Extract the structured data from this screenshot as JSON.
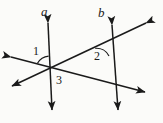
{
  "figure": {
    "background_color": "#fbfbf9",
    "stroke_color": "#1a1a1a",
    "width": 163,
    "height": 123,
    "line_labels": [
      {
        "id": "a",
        "text": "a",
        "x": 41,
        "y": 5
      },
      {
        "id": "b",
        "text": "b",
        "x": 98,
        "y": 6
      }
    ],
    "angle_labels": [
      {
        "id": "1",
        "text": "1",
        "x": 33,
        "y": 45
      },
      {
        "id": "2",
        "text": "2",
        "x": 94,
        "y": 50
      },
      {
        "id": "3",
        "text": "3",
        "x": 56,
        "y": 74
      }
    ],
    "lines": [
      {
        "name": "line-a",
        "label": "a",
        "from": {
          "x": 48,
          "y": 20
        },
        "to": {
          "x": 52,
          "y": 113
        },
        "arrow_start": true,
        "arrow_end": true
      },
      {
        "name": "line-b",
        "label": "b",
        "from": {
          "x": 112,
          "y": 22
        },
        "to": {
          "x": 118,
          "y": 113
        },
        "arrow_start": true,
        "arrow_end": true
      },
      {
        "name": "transversal-upper",
        "label": "",
        "from": {
          "x": 148,
          "y": 22
        },
        "to": {
          "x": 9,
          "y": 88
        },
        "arrow_start": true,
        "arrow_end": true
      },
      {
        "name": "transversal-lower",
        "label": "",
        "from": {
          "x": 8,
          "y": 56
        },
        "to": {
          "x": 148,
          "y": 93
        },
        "arrow_start": true,
        "arrow_end": true
      }
    ],
    "intersections": [
      {
        "name": "left-vertex",
        "x": 50,
        "y": 70
      },
      {
        "name": "right-upper-vertex",
        "x": 108,
        "y": 42
      },
      {
        "name": "right-lower-vertex",
        "x": 120,
        "y": 88
      }
    ],
    "angle_arcs": [
      {
        "name": "arc-angle-1",
        "cx": 50,
        "cy": 70,
        "radius": 14
      },
      {
        "name": "arc-angle-2",
        "cx": 108,
        "cy": 42,
        "radius": 14
      }
    ]
  }
}
